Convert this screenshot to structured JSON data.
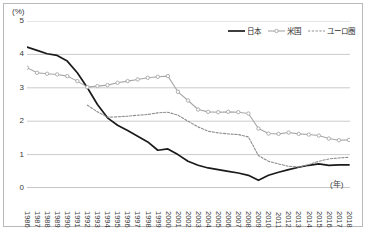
{
  "chart_data": {
    "type": "line",
    "title": "",
    "xlabel": "(年)",
    "ylabel": "(%)",
    "ylim": [
      0,
      5
    ],
    "yticks": [
      0,
      1,
      2,
      3,
      4,
      5
    ],
    "grid": true,
    "legend_position": "top-right",
    "categories": [
      "1986",
      "1987",
      "1988",
      "1989",
      "1990",
      "1991",
      "1992",
      "1993",
      "1994",
      "1995",
      "1996",
      "1997",
      "1998",
      "1999",
      "2000",
      "2001",
      "2002",
      "2003",
      "2004",
      "2005",
      "2006",
      "2007",
      "2008",
      "2009",
      "2010",
      "2011",
      "2012",
      "2013",
      "2014",
      "2015",
      "2016",
      "2017",
      "2018"
    ],
    "series": [
      {
        "name": "日本",
        "color": "#1a1a1a",
        "style": "solid",
        "markers": false,
        "values": [
          4.22,
          4.12,
          4.02,
          3.97,
          3.8,
          3.45,
          3.0,
          2.5,
          2.1,
          1.88,
          1.72,
          1.55,
          1.38,
          1.13,
          1.17,
          1.0,
          0.8,
          0.68,
          0.6,
          0.55,
          0.5,
          0.45,
          0.38,
          0.23,
          0.38,
          0.47,
          0.55,
          0.62,
          0.68,
          0.72,
          0.68,
          0.69,
          0.69
        ]
      },
      {
        "name": "米国",
        "color": "#a6a6a6",
        "style": "solid",
        "markers": true,
        "values": [
          3.6,
          3.45,
          3.42,
          3.4,
          3.35,
          3.2,
          3.02,
          3.05,
          3.08,
          3.15,
          3.2,
          3.25,
          3.3,
          3.33,
          3.35,
          2.88,
          2.62,
          2.35,
          2.28,
          2.27,
          2.28,
          2.27,
          2.23,
          1.78,
          1.63,
          1.62,
          1.66,
          1.62,
          1.6,
          1.57,
          1.48,
          1.43,
          1.44
        ]
      },
      {
        "name": "ユーロ圏",
        "color": "#8c8c8c",
        "style": "dotted",
        "markers": false,
        "values": [
          null,
          null,
          null,
          null,
          null,
          null,
          2.48,
          2.28,
          2.12,
          2.13,
          2.15,
          2.18,
          2.2,
          2.25,
          2.27,
          2.18,
          2.0,
          1.83,
          1.7,
          1.65,
          1.62,
          1.6,
          1.53,
          0.97,
          0.8,
          0.72,
          0.65,
          0.63,
          0.7,
          0.8,
          0.87,
          0.9,
          0.92
        ]
      }
    ]
  }
}
